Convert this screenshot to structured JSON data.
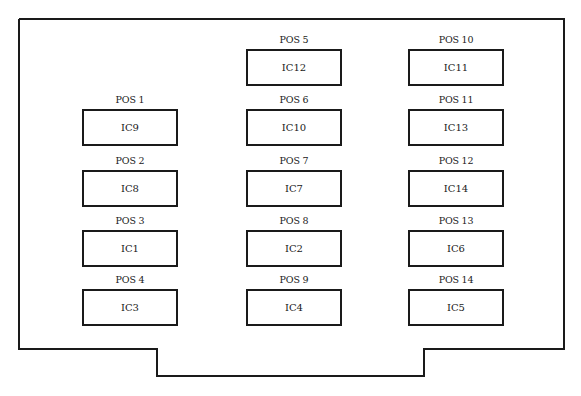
{
  "diagram": {
    "type": "circuit-board-ic-layout",
    "outline_color": "#1a1a1a",
    "slots": [
      {
        "pos": "POS 1",
        "ic": "IC9",
        "col": 0,
        "row": 1
      },
      {
        "pos": "POS 2",
        "ic": "IC8",
        "col": 0,
        "row": 2
      },
      {
        "pos": "POS 3",
        "ic": "IC1",
        "col": 0,
        "row": 3
      },
      {
        "pos": "POS 4",
        "ic": "IC3",
        "col": 0,
        "row": 4
      },
      {
        "pos": "POS 5",
        "ic": "IC12",
        "col": 1,
        "row": 0
      },
      {
        "pos": "POS 6",
        "ic": "IC10",
        "col": 1,
        "row": 1
      },
      {
        "pos": "POS 7",
        "ic": "IC7",
        "col": 1,
        "row": 2
      },
      {
        "pos": "POS 8",
        "ic": "IC2",
        "col": 1,
        "row": 3
      },
      {
        "pos": "POS 9",
        "ic": "IC4",
        "col": 1,
        "row": 4
      },
      {
        "pos": "POS 10",
        "ic": "IC11",
        "col": 2,
        "row": 0
      },
      {
        "pos": "POS 11",
        "ic": "IC13",
        "col": 2,
        "row": 1
      },
      {
        "pos": "POS 12",
        "ic": "IC14",
        "col": 2,
        "row": 2
      },
      {
        "pos": "POS 13",
        "ic": "IC6",
        "col": 2,
        "row": 3
      },
      {
        "pos": "POS 14",
        "ic": "IC5",
        "col": 2,
        "row": 4
      }
    ]
  }
}
